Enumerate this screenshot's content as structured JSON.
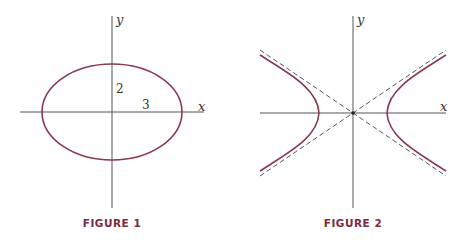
{
  "figures": [
    {
      "caption": "FIGURE 1",
      "type": "ellipse",
      "axis_labels": {
        "x": "x",
        "y": "y"
      },
      "annotations": {
        "semi_minor": "2",
        "semi_major": "3"
      },
      "params": {
        "a": 3,
        "b": 2
      }
    },
    {
      "caption": "FIGURE 2",
      "type": "hyperbola",
      "axis_labels": {
        "x": "x",
        "y": "y"
      },
      "asymptotes": "dashed"
    }
  ],
  "colors": {
    "curve": "#8b3a4a",
    "axis": "#555555",
    "caption": "#7a2a40"
  }
}
